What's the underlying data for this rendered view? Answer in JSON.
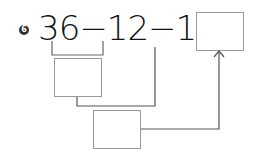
{
  "problem": {
    "number": "6",
    "expression": "36−12−11=",
    "terms": [
      "36",
      "12",
      "11"
    ],
    "operators": [
      "−",
      "−",
      "="
    ]
  },
  "boxes": {
    "answer": "",
    "step1": "",
    "step2": ""
  },
  "colors": {
    "text": "#111111",
    "lines": "#666666",
    "box_border": "#999999"
  }
}
